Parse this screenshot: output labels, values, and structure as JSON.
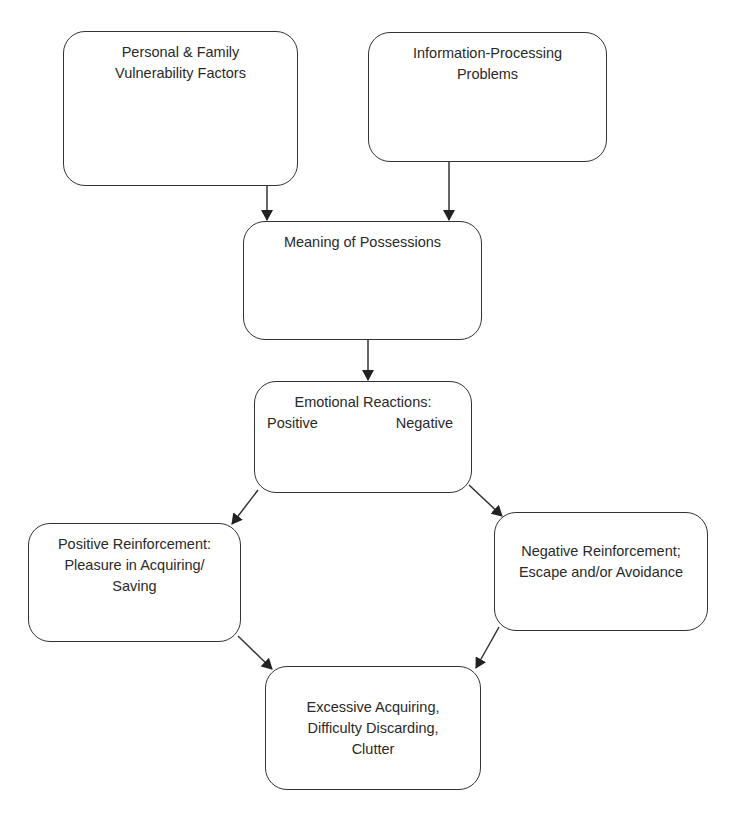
{
  "diagram": {
    "type": "flowchart",
    "line_color": "#333333",
    "background": "#ffffff",
    "nodes": {
      "personal": {
        "lines": [
          "Personal & Family",
          "Vulnerability Factors"
        ]
      },
      "info": {
        "lines": [
          "Information-Processing",
          "Problems"
        ]
      },
      "meaning": {
        "lines": [
          "Meaning of Possessions"
        ]
      },
      "emotional": {
        "title": "Emotional Reactions:",
        "positive": "Positive",
        "negative": "Negative"
      },
      "positive_reinf": {
        "lines": [
          "Positive Reinforcement:",
          "Pleasure in Acquiring/",
          "Saving"
        ]
      },
      "negative_reinf": {
        "lines": [
          "Negative Reinforcement;",
          "Escape and/or Avoidance"
        ]
      },
      "outcome": {
        "lines": [
          "Excessive Acquiring,",
          "Difficulty Discarding,",
          "Clutter"
        ]
      }
    },
    "edges": [
      {
        "from": "personal",
        "to": "meaning"
      },
      {
        "from": "info",
        "to": "meaning"
      },
      {
        "from": "meaning",
        "to": "emotional"
      },
      {
        "from": "emotional",
        "to": "positive_reinf"
      },
      {
        "from": "emotional",
        "to": "negative_reinf"
      },
      {
        "from": "positive_reinf",
        "to": "outcome"
      },
      {
        "from": "negative_reinf",
        "to": "outcome"
      }
    ]
  }
}
